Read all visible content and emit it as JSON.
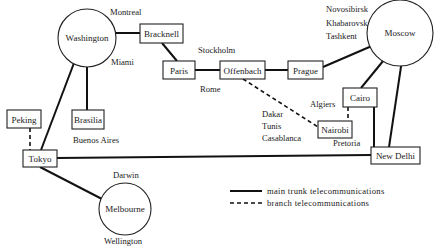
{
  "hubs": {
    "washington": "Washington",
    "moscow": "Moscow",
    "melbourne": "Melbourne"
  },
  "stations": {
    "bracknell": "Bracknell",
    "paris": "Paris",
    "offenbach": "Offenbach",
    "prague": "Prague",
    "cairo": "Cairo",
    "nairobi": "Nairobi",
    "new_delhi": "New Delhi",
    "peking": "Peking",
    "brasilia": "Brasilia",
    "tokyo": "Tokyo"
  },
  "cities": {
    "montreal": "Montreal",
    "miami": "Miami",
    "stockholm": "Stockholm",
    "rome": "Rome",
    "novosibirsk": "Novosibirsk",
    "khabarovsk": "Khabarovsk",
    "tashkent": "Tashkent",
    "algiers": "Algiers",
    "dakar": "Dakar",
    "tunis": "Tunis",
    "casablanca": "Casablanca",
    "pretoria": "Pretoria",
    "buenos_aires": "Buenos Aires",
    "darwin": "Darwin",
    "wellington": "Wellington"
  },
  "legend": {
    "main": "main trunk telecommunications",
    "branch": "branch telecommunications"
  },
  "connections": {
    "main_trunk": [
      [
        "Washington",
        "Bracknell"
      ],
      [
        "Bracknell",
        "Paris"
      ],
      [
        "Paris",
        "Offenbach"
      ],
      [
        "Offenbach",
        "Prague"
      ],
      [
        "Prague",
        "Moscow"
      ],
      [
        "Moscow",
        "Cairo"
      ],
      [
        "Moscow",
        "New Delhi"
      ],
      [
        "Cairo",
        "New Delhi"
      ],
      [
        "Washington",
        "Brasilia"
      ],
      [
        "Washington",
        "Tokyo"
      ],
      [
        "Tokyo",
        "New Delhi"
      ],
      [
        "Tokyo",
        "Melbourne"
      ]
    ],
    "branch": [
      [
        "Offenbach",
        "Nairobi"
      ],
      [
        "Cairo",
        "Nairobi"
      ],
      [
        "Peking",
        "Tokyo"
      ]
    ]
  }
}
